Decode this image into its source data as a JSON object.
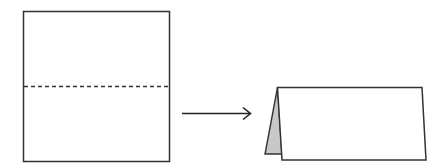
{
  "diagram": {
    "colors": {
      "stroke": "#333333",
      "background": "#ffffff",
      "back_flap_fill": "#c8c8c8"
    },
    "steps": [
      {
        "name": "unfolded-sheet",
        "fold_line": "dashed horizontal midline"
      },
      {
        "name": "transition-arrow",
        "direction": "right"
      },
      {
        "name": "folded-tent-card",
        "shows_back_flap": true
      }
    ]
  }
}
